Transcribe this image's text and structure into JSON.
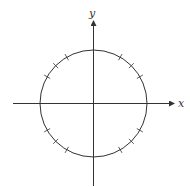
{
  "diagram": {
    "type": "unit-circle",
    "axes": {
      "x_label": "x",
      "y_label": "y"
    },
    "circle": {
      "cx": 93.5,
      "cy": 103.5,
      "r": 53.5
    },
    "tick_angles_deg": [
      30,
      45,
      60,
      120,
      135,
      150,
      210,
      225,
      240,
      300,
      315,
      330
    ],
    "colors": {
      "stroke": "#333333",
      "background": "#ffffff"
    }
  }
}
